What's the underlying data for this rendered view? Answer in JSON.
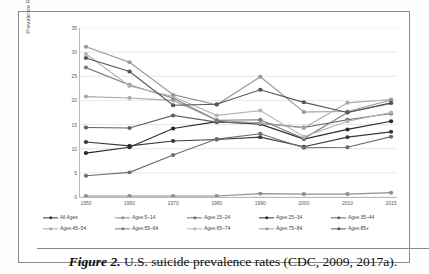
{
  "figure": {
    "caption_label": "Figure 2.",
    "caption_text": " U.S. suicide prevalence rates (CDC, 2009, 2017a)."
  },
  "chart_data": {
    "type": "line",
    "title": "",
    "xlabel": "",
    "ylabel": "Prevalence Rate per 100,000",
    "categories": [
      "1950",
      "1960",
      "1970",
      "1980",
      "1990",
      "2000",
      "2010",
      "2015"
    ],
    "x": [
      1950,
      1960,
      1970,
      1980,
      1990,
      2000,
      2010,
      2015
    ],
    "ylim": [
      0,
      35
    ],
    "yticks": [
      0,
      5,
      10,
      15,
      20,
      25,
      30,
      35
    ],
    "grid": true,
    "legend_position": "bottom",
    "markers": true,
    "series": [
      {
        "name": "All Ages",
        "color": "#3a3a3a",
        "values": [
          11.4,
          10.6,
          11.6,
          11.9,
          12.4,
          10.4,
          12.4,
          13.5
        ]
      },
      {
        "name": "Ages 5–14",
        "color": "#8f8f8f",
        "values": [
          0.2,
          0.2,
          0.2,
          0.2,
          0.7,
          0.6,
          0.6,
          0.9
        ]
      },
      {
        "name": "Ages 15–24",
        "color": "#6e6e6e",
        "values": [
          4.4,
          5.1,
          8.7,
          12.0,
          13.1,
          10.2,
          10.3,
          12.5
        ]
      },
      {
        "name": "Ages 25–34",
        "color": "#2b2b2b",
        "values": [
          9.1,
          10.3,
          14.2,
          15.6,
          15.1,
          12.0,
          14.0,
          15.7
        ]
      },
      {
        "name": "Ages 35–44",
        "color": "#616161",
        "values": [
          14.4,
          14.3,
          16.9,
          15.5,
          15.3,
          14.4,
          16.0,
          17.3
        ]
      },
      {
        "name": "Ages 45–54",
        "color": "#a9a9a9",
        "values": [
          20.8,
          20.5,
          20.0,
          15.9,
          15.3,
          14.3,
          19.5,
          20.2
        ]
      },
      {
        "name": "Ages 55–64",
        "color": "#7c7c7c",
        "values": [
          26.8,
          23.2,
          20.5,
          15.9,
          16.0,
          12.1,
          17.5,
          19.4
        ]
      },
      {
        "name": "Ages 65–74",
        "color": "#b5b5b5",
        "values": [
          29.6,
          23.0,
          20.8,
          16.9,
          17.9,
          12.5,
          15.7,
          17.5
        ]
      },
      {
        "name": "Ages 75–84",
        "color": "#999999",
        "values": [
          31.1,
          27.9,
          21.2,
          19.1,
          24.9,
          17.6,
          17.7,
          20.1
        ]
      },
      {
        "name": "Ages  85+",
        "color": "#555555",
        "values": [
          28.8,
          26.0,
          19.0,
          19.2,
          22.2,
          19.6,
          17.5,
          19.5
        ]
      }
    ]
  }
}
